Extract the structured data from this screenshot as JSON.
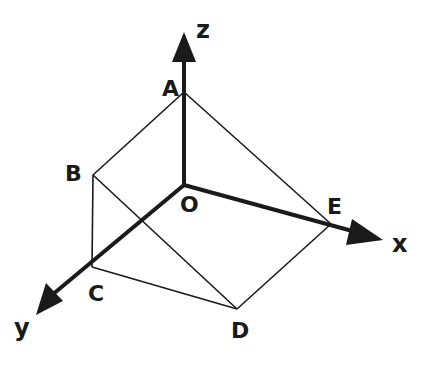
{
  "diagram": {
    "type": "3d-coordinate-solid",
    "axes": {
      "x": {
        "label": "x"
      },
      "y": {
        "label": "y"
      },
      "z": {
        "label": "z"
      }
    },
    "points": {
      "O": {
        "label": "O"
      },
      "A": {
        "label": "A"
      },
      "B": {
        "label": "B"
      },
      "C": {
        "label": "C"
      },
      "D": {
        "label": "D"
      },
      "E": {
        "label": "E"
      }
    },
    "edges": [
      "AB",
      "AE",
      "BC",
      "BD",
      "CD",
      "DE",
      "AO",
      "OC",
      "OE"
    ],
    "colors": {
      "stroke": "#1a1a1a",
      "background": "#ffffff"
    }
  }
}
